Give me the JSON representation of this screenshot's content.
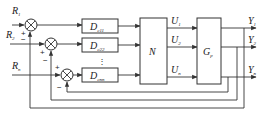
{
  "diagram": {
    "type": "MIMO decoupling control block diagram",
    "inputs": [
      {
        "name": "R",
        "sub": "1"
      },
      {
        "name": "R",
        "sub": "2"
      },
      {
        "name": "R",
        "sub": "n"
      }
    ],
    "summing_junctions": [
      {
        "id": "sum1",
        "ref_sign": "+",
        "fb_sign": "−"
      },
      {
        "id": "sum2",
        "ref_sign": "+",
        "fb_sign": "−"
      },
      {
        "id": "sum3",
        "ref_sign": "+",
        "fb_sign": "−"
      }
    ],
    "controllers": [
      {
        "name": "D",
        "sub": "c11"
      },
      {
        "name": "D",
        "sub": "c22"
      },
      {
        "name": "D",
        "sub": "cnn"
      }
    ],
    "ellipsis": "⋮",
    "decoupler": {
      "name": "N"
    },
    "control_signals": [
      {
        "name": "U",
        "sub": "1"
      },
      {
        "name": "U",
        "sub": "2"
      },
      {
        "name": "U",
        "sub": "n"
      }
    ],
    "plant": {
      "name": "G",
      "sub": "p"
    },
    "outputs": [
      {
        "name": "Y",
        "sub": "1"
      },
      {
        "name": "Y",
        "sub": "2"
      },
      {
        "name": "Y",
        "sub": "n"
      }
    ],
    "colors": {
      "line": "#333333",
      "background": "#ffffff"
    }
  }
}
